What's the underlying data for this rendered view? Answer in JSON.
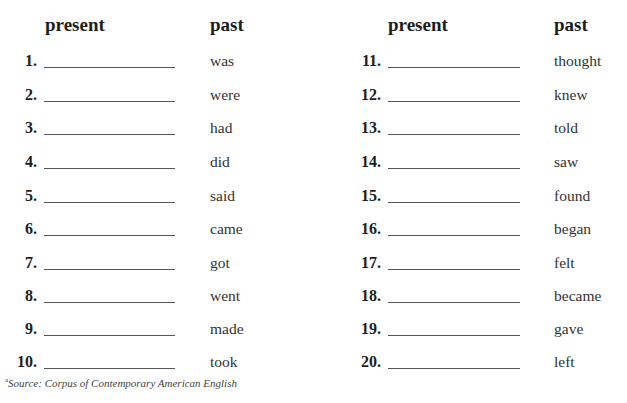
{
  "headers": {
    "left_present": "present",
    "left_past": "past",
    "right_present": "present",
    "right_past": "past"
  },
  "left_items": [
    {
      "num": "1.",
      "past": "was"
    },
    {
      "num": "2.",
      "past": "were"
    },
    {
      "num": "3.",
      "past": "had"
    },
    {
      "num": "4.",
      "past": "did"
    },
    {
      "num": "5.",
      "past": "said"
    },
    {
      "num": "6.",
      "past": "came"
    },
    {
      "num": "7.",
      "past": "got"
    },
    {
      "num": "8.",
      "past": "went"
    },
    {
      "num": "9.",
      "past": "made"
    },
    {
      "num": "10.",
      "past": "took"
    }
  ],
  "right_items": [
    {
      "num": "11.",
      "past": "thought"
    },
    {
      "num": "12.",
      "past": "knew"
    },
    {
      "num": "13.",
      "past": "told"
    },
    {
      "num": "14.",
      "past": "saw"
    },
    {
      "num": "15.",
      "past": "found"
    },
    {
      "num": "16.",
      "past": "began"
    },
    {
      "num": "17.",
      "past": "felt"
    },
    {
      "num": "18.",
      "past": "became"
    },
    {
      "num": "19.",
      "past": "gave"
    },
    {
      "num": "20.",
      "past": "left"
    }
  ],
  "footnote": {
    "marker": "a",
    "text": "Source: Corpus of Contemporary American English"
  }
}
